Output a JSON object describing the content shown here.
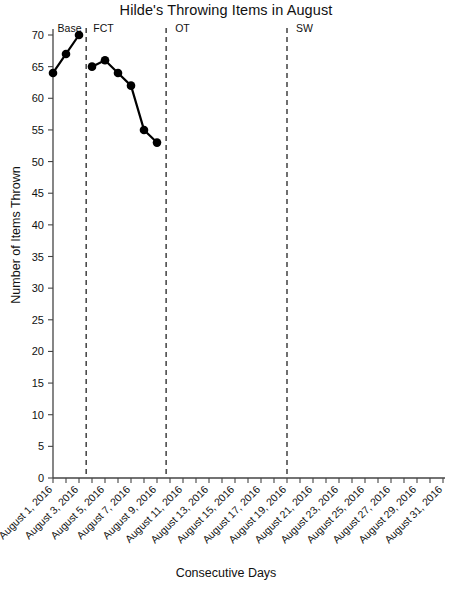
{
  "chart_data": {
    "type": "line",
    "title": "Hilde's Throwing Items in August",
    "xlabel": "Consecutive Days",
    "ylabel": "Number of Items Thrown",
    "ylim": [
      0,
      70
    ],
    "ytick_step": 5,
    "yticks": [
      0,
      5,
      10,
      15,
      20,
      25,
      30,
      35,
      40,
      45,
      50,
      55,
      60,
      65,
      70
    ],
    "xlim": [
      1,
      31
    ],
    "xticks": [
      1,
      2,
      3,
      4,
      5,
      6,
      7,
      8,
      9,
      10,
      11,
      12,
      13,
      14,
      15,
      16,
      17,
      18,
      19,
      20,
      21,
      22,
      23,
      24,
      25,
      26,
      27,
      28,
      29,
      30,
      31
    ],
    "xtick_labels": [
      "August 1, 2016",
      "August 3, 2016",
      "August 5, 2016",
      "August 7, 2016",
      "August 9, 2016",
      "August 11, 2016",
      "August 13, 2016",
      "August 15, 2016",
      "August 17, 2016",
      "August 19, 2016",
      "August 21, 2016",
      "August 23, 2016",
      "August 25, 2016",
      "August 27, 2016",
      "August 29, 2016",
      "August 31, 2016"
    ],
    "xtick_label_days": [
      1,
      3,
      5,
      7,
      9,
      11,
      13,
      15,
      17,
      19,
      21,
      23,
      25,
      27,
      29,
      31
    ],
    "grid": false,
    "legend": "none",
    "marker": "filled-circle",
    "line_color": "#000000",
    "marker_color": "#000000",
    "phases": [
      {
        "name": "Base",
        "label_day": 1.35,
        "divider_day": 3.55
      },
      {
        "name": "FCT",
        "label_day": 4.1,
        "divider_day": 9.7
      },
      {
        "name": "OT",
        "label_day": 10.4,
        "divider_day": 19.0
      },
      {
        "name": "SW",
        "label_day": 19.7,
        "divider_day": null
      }
    ],
    "series": [
      {
        "name": "Base",
        "x": [
          1,
          2,
          3
        ],
        "values": [
          64,
          67,
          70
        ]
      },
      {
        "name": "FCT",
        "x": [
          4,
          5,
          6,
          7,
          8,
          9
        ],
        "values": [
          65,
          66,
          64,
          62,
          55,
          53
        ]
      },
      {
        "name": "OT",
        "x": [],
        "values": []
      },
      {
        "name": "SW",
        "x": [],
        "values": []
      }
    ]
  }
}
